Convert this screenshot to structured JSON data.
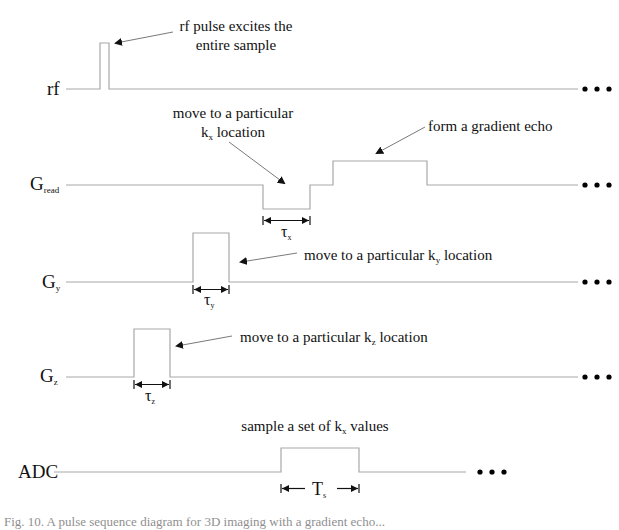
{
  "diagram": {
    "type": "pulse-sequence",
    "rows": [
      {
        "id": "rf",
        "label": "rf",
        "sub": ""
      },
      {
        "id": "gread",
        "label": "G",
        "sub": "read"
      },
      {
        "id": "gy",
        "label": "G",
        "sub": "y"
      },
      {
        "id": "gz",
        "label": "G",
        "sub": "z"
      },
      {
        "id": "adc",
        "label": "ADC",
        "sub": ""
      }
    ],
    "annotations": {
      "rf_line1": "rf pulse excites the",
      "rf_line2": "entire sample",
      "kx_line1": "move to a particular",
      "kx_line2_pre": "k",
      "kx_line2_sub": "x",
      "kx_line2_post": " location",
      "echo": "form a gradient echo",
      "ky_pre": "move to a particular k",
      "ky_sub": "y",
      "ky_post": " location",
      "kz_pre": "move to a particular k",
      "kz_sub": "z",
      "kz_post": " location",
      "adc_pre": "sample a set of k",
      "adc_sub": "x",
      "adc_post": " values"
    },
    "dimensions": {
      "tau_x": {
        "sym": "τ",
        "sub": "x"
      },
      "tau_y": {
        "sym": "τ",
        "sub": "y"
      },
      "tau_z": {
        "sym": "τ",
        "sub": "z"
      },
      "t_s": {
        "sym": "T",
        "sub": "s"
      }
    },
    "continuation": "•••"
  },
  "caption": "Fig. 10. A pulse sequence diagram for 3D imaging with a gradient echo..."
}
